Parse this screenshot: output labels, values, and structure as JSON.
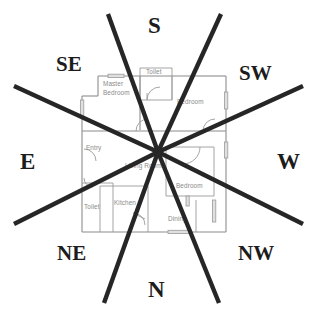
{
  "diagram": {
    "type": "floor-plan-with-compass-overlay",
    "canvas": {
      "width": 315,
      "height": 317,
      "background": "#ffffff"
    },
    "center_point": {
      "x": 158,
      "y": 152
    }
  },
  "compass": {
    "note": "Eight bold radiating lines from the plan centre divide the plan into eight sectors, each annotated with a direction abbreviation.",
    "line_color": "#262626",
    "label_color": "#1c1c1c",
    "directions": [
      {
        "abbr": "S",
        "name": "south",
        "position": "top"
      },
      {
        "abbr": "SE",
        "name": "south-east",
        "position": "top-left"
      },
      {
        "abbr": "SW",
        "name": "south-west",
        "position": "top-right"
      },
      {
        "abbr": "E",
        "name": "east",
        "position": "left"
      },
      {
        "abbr": "W",
        "name": "west",
        "position": "right"
      },
      {
        "abbr": "NE",
        "name": "north-east",
        "position": "bottom-left"
      },
      {
        "abbr": "NW",
        "name": "north-west",
        "position": "bottom-right"
      },
      {
        "abbr": "N",
        "name": "north",
        "position": "bottom"
      }
    ]
  },
  "floorplan": {
    "wall_color": "#8c8c8c",
    "label_color": "#8a8a8a",
    "rooms": [
      {
        "label": "Master Bedroom",
        "sector": "SE",
        "x": 103,
        "y": 83
      },
      {
        "label": "Toilet",
        "sector": "S",
        "x": 155,
        "y": 73
      },
      {
        "label": "Bedroom",
        "sector": "SW",
        "x": 190,
        "y": 103
      },
      {
        "label": "Entry",
        "sector": "E",
        "x": 85,
        "y": 147
      },
      {
        "label": "Living Room",
        "sector": "centre",
        "x": 131,
        "y": 166
      },
      {
        "label": "Bedroom",
        "sector": "W",
        "x": 189,
        "y": 185
      },
      {
        "label": "Toilet",
        "sector": "NE",
        "x": 86,
        "y": 207
      },
      {
        "label": "Kitchen",
        "sector": "N",
        "x": 115,
        "y": 203
      },
      {
        "label": "Dining",
        "sector": "NW",
        "x": 172,
        "y": 218
      }
    ]
  }
}
